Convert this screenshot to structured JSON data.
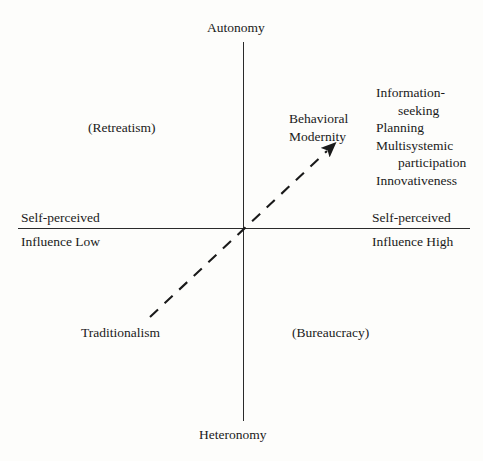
{
  "diagram": {
    "type": "two-axis quadrant conceptual diagram",
    "axes": {
      "vertical": {
        "top_label": "Autonomy",
        "bottom_label": "Heteronomy"
      },
      "horizontal": {
        "left_label": {
          "line1": "Self-perceived",
          "line2": "Influence Low"
        },
        "right_label": {
          "line1": "Self-perceived",
          "line2": "Influence High"
        }
      }
    },
    "quadrants": [
      {
        "name": "upper-left",
        "label": "(Retreatism)"
      },
      {
        "name": "lower-right",
        "label": "(Bureaucracy)"
      },
      {
        "name": "lower-left",
        "label": "Traditionalism"
      }
    ],
    "trend_arrow": {
      "caption_line1": "Behavioral",
      "caption_line2": "Modernity",
      "style": "dashed diagonal with solid arrowhead",
      "direction": "from lower-left (Traditionalism) to upper-right"
    },
    "attributes": [
      {
        "main": "Information-",
        "cont": "seeking"
      },
      {
        "main": "Planning",
        "cont": ""
      },
      {
        "main": "Multisystemic",
        "cont": "participation"
      },
      {
        "main": "Innovativeness",
        "cont": ""
      }
    ],
    "colors": {
      "background": "#fdfdfb",
      "ink": "#1a1a1a",
      "axis": "#2a2a2a"
    }
  }
}
